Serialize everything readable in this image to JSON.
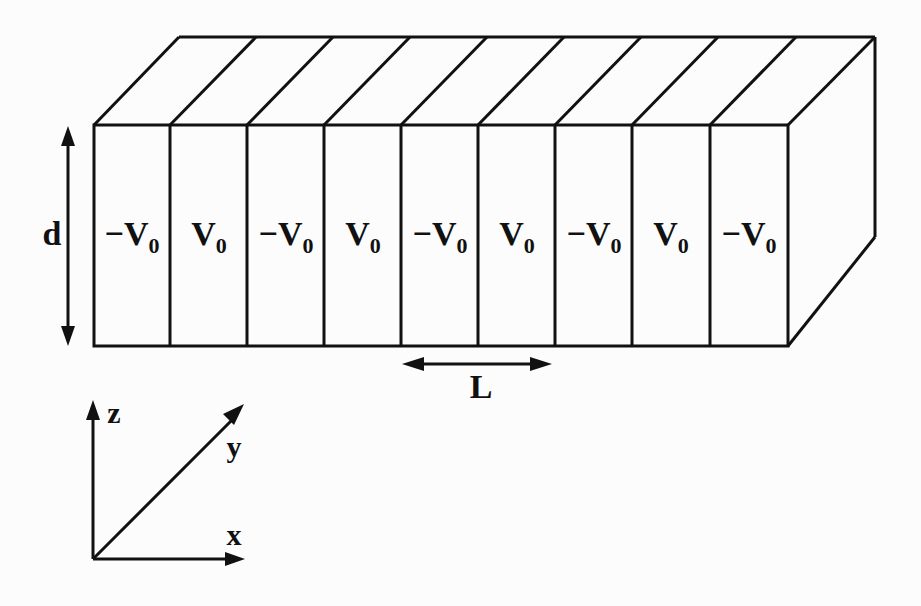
{
  "diagram": {
    "type": "periodic potential slab",
    "strips": [
      {
        "label": "−V",
        "subscript": "0"
      },
      {
        "label": "V",
        "subscript": "0"
      },
      {
        "label": "−V",
        "subscript": "0"
      },
      {
        "label": "V",
        "subscript": "0"
      },
      {
        "label": "−V",
        "subscript": "0"
      },
      {
        "label": "V",
        "subscript": "0"
      },
      {
        "label": "−V",
        "subscript": "0"
      },
      {
        "label": "V",
        "subscript": "0"
      },
      {
        "label": "−V",
        "subscript": "0"
      }
    ],
    "dimension_labels": {
      "thickness": "d",
      "period": "L"
    },
    "axes": {
      "x": "x",
      "y": "y",
      "z": "z"
    }
  }
}
